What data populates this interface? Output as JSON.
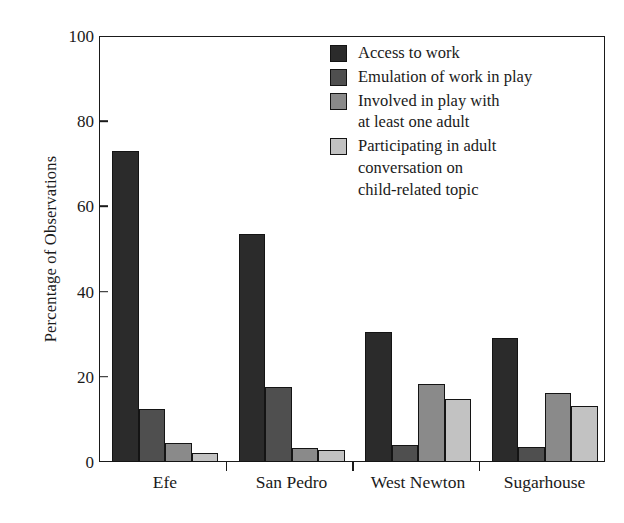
{
  "chart_data": {
    "type": "bar",
    "title": "",
    "subtitle": "",
    "xlabel": "",
    "ylabel": "Percentage of Observations",
    "ylim": [
      0,
      100
    ],
    "yticks": [
      0,
      20,
      40,
      60,
      80,
      100
    ],
    "ytick_labels": [
      "0",
      "20",
      "40",
      "60",
      "80",
      "100"
    ],
    "grid": false,
    "legend_position": "upper-right-inside",
    "categories": [
      "Efe",
      "San Pedro",
      "West Newton",
      "Sugarhouse"
    ],
    "series": [
      {
        "name": "Access to work",
        "color": "#2b2b2b",
        "values": [
          73,
          53.5,
          30.5,
          29
        ]
      },
      {
        "name": "Emulation of work in play",
        "color": "#4f4f4f",
        "values": [
          12.5,
          17.5,
          4,
          3.5
        ]
      },
      {
        "name": "Involved in play with\nat least one adult",
        "color": "#8a8a8a",
        "values": [
          4.5,
          3.2,
          18.2,
          16.2
        ]
      },
      {
        "name": "Participating in adult\nconversation on\nchild-related topic",
        "color": "#c2c2c2",
        "values": [
          2.2,
          2.8,
          14.8,
          13.2
        ]
      }
    ]
  },
  "legend": {
    "items": [
      {
        "label": "Access to work",
        "swatch": "#2b2b2b"
      },
      {
        "label": "Emulation of work in play",
        "swatch": "#4f4f4f"
      },
      {
        "label": "Involved in play with\nat least one adult",
        "swatch": "#8a8a8a"
      },
      {
        "label": "Participating in adult\nconversation on\nchild-related topic",
        "swatch": "#c2c2c2"
      }
    ]
  },
  "axes": {
    "y_title": "Percentage of Observations",
    "y_tick_labels": [
      "100",
      "80",
      "60",
      "40",
      "20",
      "0"
    ],
    "x_tick_labels": [
      "Efe",
      "San Pedro",
      "West Newton",
      "Sugarhouse"
    ]
  }
}
